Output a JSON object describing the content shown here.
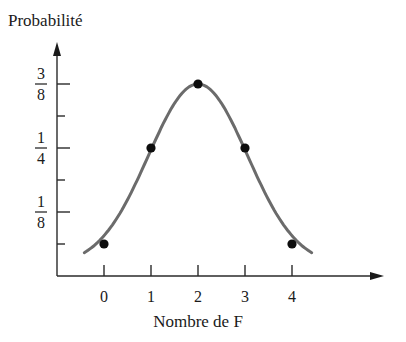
{
  "chart_data": {
    "type": "line",
    "title": "",
    "xlabel": "Nombre de F",
    "ylabel": "Probabilité",
    "x": [
      0,
      1,
      2,
      3,
      4
    ],
    "categories": [
      "0",
      "1",
      "2",
      "3",
      "4"
    ],
    "values": [
      0.0625,
      0.25,
      0.375,
      0.25,
      0.0625
    ],
    "value_labels": [
      "1/16",
      "1/4",
      "3/8",
      "1/4",
      "1/16"
    ],
    "series": [
      {
        "name": "Probabilité",
        "values": [
          0.0625,
          0.25,
          0.375,
          0.25,
          0.0625
        ],
        "style": "smooth curve with markers"
      }
    ],
    "y_ticks": [
      {
        "value": 0.0625,
        "label": ""
      },
      {
        "value": 0.125,
        "num": "1",
        "den": "8"
      },
      {
        "value": 0.1875,
        "label": ""
      },
      {
        "value": 0.25,
        "num": "1",
        "den": "4"
      },
      {
        "value": 0.3125,
        "label": ""
      },
      {
        "value": 0.375,
        "num": "3",
        "den": "8"
      }
    ],
    "x_ticks": [
      "0",
      "1",
      "2",
      "3",
      "4"
    ],
    "ylim": [
      0,
      0.4375
    ],
    "xlim": [
      -0.8,
      5.0
    ],
    "grid": false,
    "legend": "none",
    "colors": {
      "curve": "#6b6b6b",
      "points": "#0d0d0d",
      "axes": "#2a2a2a"
    }
  }
}
